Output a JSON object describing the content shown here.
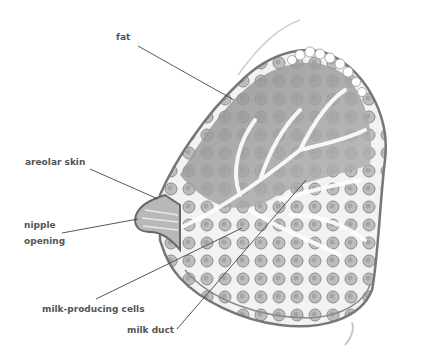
{
  "diagram": {
    "type": "anatomical-cross-section",
    "labels": [
      {
        "id": "fat",
        "text": "fat",
        "x": 116,
        "y": 33
      },
      {
        "id": "areolar-skin",
        "text": "areolar skin",
        "x": 25,
        "y": 157
      },
      {
        "id": "nipple",
        "text": "nipple",
        "x": 24,
        "y": 220
      },
      {
        "id": "opening",
        "text": "opening",
        "x": 24,
        "y": 237
      },
      {
        "id": "milk-producing-cells",
        "text": "milk-producing cells",
        "x": 42,
        "y": 303
      },
      {
        "id": "milk-duct",
        "text": "milk duct",
        "x": 127,
        "y": 326
      }
    ],
    "colors": {
      "label": "#555555",
      "leader": "#444444",
      "tissue": "#9a9a9a",
      "outline": "#777777",
      "background": "#ffffff"
    }
  }
}
